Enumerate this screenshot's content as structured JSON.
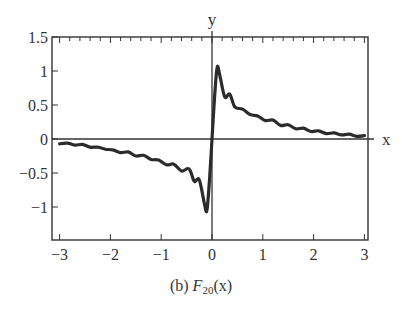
{
  "chart_data": {
    "type": "line",
    "title": "",
    "caption": {
      "prefix": "(b)",
      "func": "F",
      "sub": "20",
      "arg": "(x)"
    },
    "xlabel": "x",
    "ylabel": "y",
    "xlim": [
      -3.1,
      3.1
    ],
    "ylim": [
      -1.5,
      1.5
    ],
    "xticks": [
      -3,
      -2,
      -1,
      0,
      1,
      2,
      3
    ],
    "xtick_labels": [
      "−3",
      "−2",
      "−1",
      "0",
      "1",
      "2",
      "3"
    ],
    "yticks": [
      1.5,
      1,
      0.5,
      0,
      -0.5,
      -1
    ],
    "ytick_labels": [
      "1.5",
      "1",
      "0.5",
      "0",
      "−0.5",
      "−1"
    ],
    "grid": false,
    "legend": null,
    "series": [
      {
        "name": "F20(x)",
        "x": [
          -3.0,
          -2.85,
          -2.7,
          -2.55,
          -2.4,
          -2.25,
          -2.1,
          -1.95,
          -1.8,
          -1.65,
          -1.5,
          -1.35,
          -1.2,
          -1.05,
          -0.9,
          -0.75,
          -0.6,
          -0.45,
          -0.35,
          -0.25,
          -0.15,
          -0.1,
          -0.05,
          0.0,
          0.05,
          0.1,
          0.15,
          0.25,
          0.35,
          0.45,
          0.6,
          0.75,
          0.9,
          1.05,
          1.2,
          1.35,
          1.5,
          1.65,
          1.8,
          1.95,
          2.1,
          2.25,
          2.4,
          2.55,
          2.7,
          2.85,
          3.0
        ],
        "y": [
          -0.07,
          -0.06,
          -0.09,
          -0.08,
          -0.12,
          -0.12,
          -0.15,
          -0.16,
          -0.2,
          -0.19,
          -0.25,
          -0.24,
          -0.3,
          -0.31,
          -0.38,
          -0.37,
          -0.47,
          -0.44,
          -0.62,
          -0.6,
          -0.95,
          -1.05,
          -0.6,
          0.0,
          0.6,
          1.05,
          0.95,
          0.62,
          0.66,
          0.47,
          0.44,
          0.36,
          0.34,
          0.27,
          0.28,
          0.2,
          0.21,
          0.15,
          0.16,
          0.11,
          0.12,
          0.08,
          0.09,
          0.06,
          0.07,
          0.04,
          0.05
        ]
      }
    ]
  }
}
